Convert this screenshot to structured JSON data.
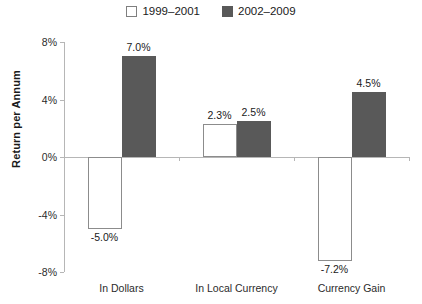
{
  "chart_data": {
    "type": "bar",
    "title": "",
    "xlabel": "",
    "ylabel": "Return per Annum",
    "ylim": [
      -8,
      8
    ],
    "ytick_values": [
      8,
      4,
      0,
      -4,
      -8
    ],
    "ytick_labels": [
      "8%",
      "4%",
      "0%",
      "-4%",
      "-8%"
    ],
    "grid": false,
    "legend_position": "top-center",
    "categories": [
      "In Dollars",
      "In Local Currency",
      "Currency Gain"
    ],
    "series": [
      {
        "name": "1999–2001",
        "style": "open",
        "color": "#ffffff",
        "border_color": "#8c8c8c",
        "values": [
          -5.0,
          2.3,
          -7.2
        ],
        "labels": [
          "-5.0%",
          "2.3%",
          "-7.2%"
        ]
      },
      {
        "name": "2002–2009",
        "style": "filled",
        "color": "#595959",
        "border_color": "#595959",
        "values": [
          7.0,
          2.5,
          4.5
        ],
        "labels": [
          "7.0%",
          "2.5%",
          "4.5%"
        ]
      }
    ]
  },
  "legend": {
    "entries": [
      {
        "label": "1999–2001",
        "swatch": "open-square-icon"
      },
      {
        "label": "2002–2009",
        "swatch": "filled-square-icon"
      }
    ]
  },
  "axes": {
    "y_title": "Return per Annum"
  }
}
